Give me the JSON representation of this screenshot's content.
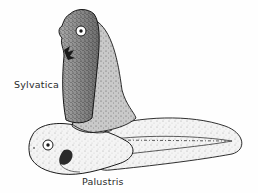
{
  "figure": {
    "labels": {
      "sylvatica": "Sylvatica",
      "palustris": "Palustris"
    },
    "specimens": [
      {
        "name": "Sylvatica",
        "orientation": "vertical",
        "shading": "dark-stippled"
      },
      {
        "name": "Palustris",
        "orientation": "horizontal",
        "shading": "light-stippled"
      }
    ],
    "colors": {
      "ink": "#1a1a1a",
      "fill_dark": "#8a8a8a",
      "fill_light": "#f2f2f2",
      "background": "#fefefe"
    }
  }
}
